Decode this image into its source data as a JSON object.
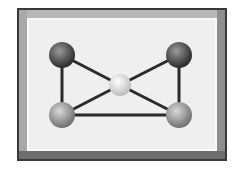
{
  "diagram": {
    "type": "molecule-graph",
    "frame": {
      "outer_border_color": "#3a3a3a",
      "bevel_color": "#9a9a9a",
      "panel_color": "#efefef"
    },
    "nodes": [
      {
        "id": "top-left",
        "x": 62,
        "y": 55,
        "r": 13,
        "color": "#2a2a2a",
        "highlight": "#9a9a9a"
      },
      {
        "id": "top-right",
        "x": 179,
        "y": 55,
        "r": 13,
        "color": "#2a2a2a",
        "highlight": "#9a9a9a"
      },
      {
        "id": "center",
        "x": 120,
        "y": 85,
        "r": 11,
        "color": "#bdbdbd",
        "highlight": "#ffffff"
      },
      {
        "id": "bottom-left",
        "x": 62,
        "y": 115,
        "r": 13,
        "color": "#707070",
        "highlight": "#d8d8d8"
      },
      {
        "id": "bottom-right",
        "x": 179,
        "y": 115,
        "r": 13,
        "color": "#707070",
        "highlight": "#d8d8d8"
      }
    ],
    "edges": [
      {
        "from": "top-left",
        "to": "bottom-left"
      },
      {
        "from": "top-left",
        "to": "center"
      },
      {
        "from": "top-right",
        "to": "center"
      },
      {
        "from": "top-right",
        "to": "bottom-right"
      },
      {
        "from": "bottom-left",
        "to": "center"
      },
      {
        "from": "bottom-right",
        "to": "center"
      },
      {
        "from": "bottom-left",
        "to": "bottom-right"
      }
    ],
    "edge_color": "#2b2b2b"
  }
}
